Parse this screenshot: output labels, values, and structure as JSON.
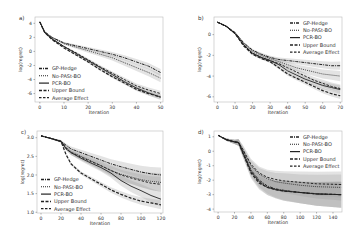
{
  "chart_data": [
    {
      "panel": "a)",
      "type": "line",
      "title": "",
      "xlabel": "Iteration",
      "ylabel": "log(regret)",
      "xlim": [
        -2,
        51
      ],
      "ylim": [
        -7.2,
        4.9
      ],
      "xticks": [
        0,
        10,
        20,
        30,
        40,
        50
      ],
      "yticks": [
        4,
        2,
        0,
        -2,
        -4,
        -6
      ],
      "grid": false,
      "legend_position": "lower left",
      "x": [
        0,
        2,
        5,
        10,
        15,
        20,
        25,
        30,
        35,
        40,
        45,
        50
      ],
      "series": [
        {
          "name": "GP-Hedge",
          "style": "dashdot",
          "band": 0.5,
          "values": [
            4.2,
            2.8,
            2.0,
            1.2,
            0.8,
            0.4,
            0.0,
            -0.4,
            -0.9,
            -1.5,
            -2.1,
            -3.0
          ]
        },
        {
          "name": "No-PASt-BO",
          "style": "dotted",
          "band": 0.6,
          "values": [
            4.2,
            2.8,
            2.0,
            1.1,
            0.6,
            0.1,
            -0.4,
            -0.9,
            -1.6,
            -2.3,
            -3.0,
            -3.8
          ]
        },
        {
          "name": "PCR-BO",
          "style": "solid",
          "band": 0.4,
          "values": [
            4.2,
            2.7,
            1.8,
            0.7,
            -0.3,
            -1.3,
            -2.3,
            -3.3,
            -4.3,
            -5.2,
            -5.9,
            -6.5
          ]
        },
        {
          "name": "Upper Bound",
          "style": "dashed",
          "band": 0.3,
          "values": [
            4.2,
            2.7,
            1.7,
            0.5,
            -0.5,
            -1.5,
            -2.6,
            -3.6,
            -4.5,
            -5.4,
            -6.0,
            -6.5
          ]
        },
        {
          "name": "Average Effect",
          "style": "longdash",
          "band": 0.4,
          "values": [
            4.2,
            2.7,
            1.8,
            0.7,
            -0.2,
            -1.2,
            -2.2,
            -3.1,
            -4.0,
            -4.9,
            -5.5,
            -6.0
          ]
        }
      ]
    },
    {
      "panel": "b)",
      "type": "line",
      "title": "",
      "xlabel": "Iteration",
      "ylabel": "log(regret)",
      "xlim": [
        -2,
        71
      ],
      "ylim": [
        -6.5,
        1.7
      ],
      "xticks": [
        0,
        10,
        20,
        30,
        40,
        50,
        60,
        70
      ],
      "yticks": [
        0,
        -2,
        -4,
        -6
      ],
      "grid": false,
      "legend_position": "upper right",
      "x": [
        0,
        5,
        10,
        15,
        20,
        25,
        30,
        35,
        40,
        45,
        50,
        55,
        60,
        65,
        70
      ],
      "series": [
        {
          "name": "GP-Hedge",
          "style": "dashdot",
          "band": 0.4,
          "values": [
            1.2,
            0.8,
            0.2,
            -0.8,
            -1.5,
            -1.9,
            -2.2,
            -2.4,
            -2.5,
            -2.6,
            -2.7,
            -2.8,
            -2.9,
            -3.0,
            -3.0
          ]
        },
        {
          "name": "No-PASt-BO",
          "style": "dotted",
          "band": 0.5,
          "values": [
            1.2,
            0.8,
            0.2,
            -0.9,
            -1.6,
            -2.0,
            -2.3,
            -2.6,
            -2.9,
            -3.2,
            -3.4,
            -3.6,
            -3.8,
            -3.9,
            -4.0
          ]
        },
        {
          "name": "PCR-BO",
          "style": "solid",
          "band": 0.4,
          "values": [
            1.2,
            0.8,
            0.1,
            -1.0,
            -1.8,
            -2.2,
            -2.5,
            -2.9,
            -3.5,
            -3.9,
            -4.3,
            -4.6,
            -4.9,
            -5.1,
            -5.3
          ]
        },
        {
          "name": "Upper Bound",
          "style": "dashed",
          "band": 0.3,
          "values": [
            1.2,
            0.8,
            0.1,
            -1.1,
            -1.9,
            -2.3,
            -2.6,
            -3.2,
            -3.8,
            -4.2,
            -4.6,
            -5.0,
            -5.4,
            -5.7,
            -5.9
          ]
        },
        {
          "name": "Average Effect",
          "style": "longdash",
          "band": 0.4,
          "values": [
            1.2,
            0.8,
            0.1,
            -1.0,
            -1.8,
            -2.2,
            -2.5,
            -2.8,
            -3.2,
            -3.6,
            -4.0,
            -4.4,
            -4.7,
            -5.0,
            -5.2
          ]
        }
      ]
    },
    {
      "panel": "c)",
      "type": "line",
      "title": "",
      "xlabel": "Iteration",
      "ylabel": "log(regret)",
      "xlim": [
        -4,
        122
      ],
      "ylim": [
        0.98,
        3.18
      ],
      "xticks": [
        0,
        20,
        40,
        60,
        80,
        100,
        120
      ],
      "yticks": [
        3.0,
        2.5,
        2.0,
        1.5,
        1.0
      ],
      "grid": false,
      "legend_position": "lower left",
      "x": [
        0,
        10,
        20,
        25,
        30,
        40,
        50,
        60,
        70,
        80,
        90,
        100,
        110,
        120
      ],
      "series": [
        {
          "name": "GP-Hedge",
          "style": "dashdot",
          "band": 0.2,
          "values": [
            3.05,
            2.98,
            2.9,
            2.8,
            2.7,
            2.6,
            2.5,
            2.4,
            2.3,
            2.22,
            2.15,
            2.08,
            2.03,
            2.0
          ]
        },
        {
          "name": "No-PASt-BO",
          "style": "dotted",
          "band": 0.25,
          "values": [
            3.05,
            2.98,
            2.9,
            2.75,
            2.62,
            2.5,
            2.38,
            2.25,
            2.12,
            2.02,
            1.95,
            1.88,
            1.83,
            1.8
          ]
        },
        {
          "name": "PCR-BO",
          "style": "solid",
          "band": 0.2,
          "values": [
            3.05,
            2.98,
            2.9,
            2.7,
            2.6,
            2.45,
            2.32,
            2.2,
            2.05,
            1.85,
            1.7,
            1.58,
            1.45,
            1.35
          ]
        },
        {
          "name": "Upper Bound",
          "style": "dashed",
          "band": 0.12,
          "values": [
            3.05,
            2.98,
            2.9,
            2.55,
            2.3,
            2.05,
            1.9,
            1.75,
            1.6,
            1.48,
            1.38,
            1.3,
            1.25,
            1.2
          ]
        },
        {
          "name": "Average Effect",
          "style": "longdash",
          "band": 0.2,
          "values": [
            3.05,
            2.98,
            2.9,
            2.72,
            2.6,
            2.48,
            2.36,
            2.25,
            2.12,
            2.0,
            1.92,
            1.85,
            1.78,
            1.75
          ]
        }
      ]
    },
    {
      "panel": "d)",
      "type": "line",
      "title": "",
      "xlabel": "Iteration",
      "ylabel": "log(regret)",
      "xlim": [
        -5,
        151
      ],
      "ylim": [
        -4.2,
        1.4
      ],
      "xticks": [
        0,
        20,
        40,
        60,
        80,
        100,
        120,
        140
      ],
      "yticks": [
        1,
        0,
        -1,
        -2,
        -3,
        -4
      ],
      "grid": false,
      "legend_position": "upper right",
      "x": [
        0,
        10,
        20,
        25,
        30,
        40,
        50,
        60,
        70,
        80,
        100,
        120,
        150
      ],
      "series": [
        {
          "name": "GP-Hedge",
          "style": "dashdot",
          "band": 0.9,
          "values": [
            1.1,
            0.8,
            0.65,
            0.6,
            0.0,
            -1.3,
            -2.0,
            -2.4,
            -2.6,
            -2.7,
            -2.85,
            -2.95,
            -3.0
          ]
        },
        {
          "name": "No-PASt-BO",
          "style": "dotted",
          "band": 0.9,
          "values": [
            1.1,
            0.8,
            0.65,
            0.6,
            0.1,
            -1.0,
            -1.6,
            -1.9,
            -2.1,
            -2.2,
            -2.35,
            -2.45,
            -2.5
          ]
        },
        {
          "name": "PCR-BO",
          "style": "solid",
          "band": 0.9,
          "values": [
            1.1,
            0.8,
            0.65,
            0.6,
            -0.1,
            -1.4,
            -2.1,
            -2.5,
            -2.65,
            -2.75,
            -2.85,
            -2.95,
            -3.0
          ]
        },
        {
          "name": "Upper Bound",
          "style": "dashed",
          "band": 0.9,
          "values": [
            1.1,
            0.8,
            0.65,
            0.6,
            -0.1,
            -1.5,
            -2.2,
            -2.5,
            -2.65,
            -2.75,
            -2.85,
            -2.95,
            -3.0
          ]
        },
        {
          "name": "Average Effect",
          "style": "longdash",
          "band": 0.9,
          "values": [
            1.1,
            0.8,
            0.65,
            0.6,
            0.15,
            -0.9,
            -1.5,
            -1.8,
            -1.95,
            -2.05,
            -2.15,
            -2.25,
            -2.3
          ]
        }
      ]
    }
  ],
  "layout": {
    "panels_px": [
      {
        "left": 35,
        "top": 17,
        "right": 163,
        "bottom": 102
      },
      {
        "left": 214,
        "top": 17,
        "right": 342,
        "bottom": 102
      },
      {
        "left": 37,
        "top": 131,
        "right": 163,
        "bottom": 213
      },
      {
        "left": 214,
        "top": 131,
        "right": 342,
        "bottom": 212
      }
    ]
  },
  "colors": {
    "line": "#222222",
    "band": "#9a9a9a",
    "frame": "#bbbbbb",
    "tick_text": "#444444"
  }
}
